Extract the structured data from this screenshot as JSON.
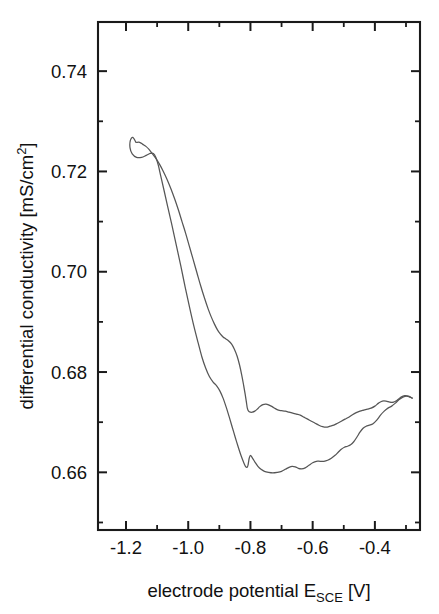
{
  "chart_data": {
    "type": "line",
    "title": "",
    "subtitle": "",
    "xlabel": "electrode potential E_SCE [V]",
    "xlabel_parts": {
      "main": "electrode potential E",
      "sub": "SCE",
      "tail": " [V]"
    },
    "ylabel": "differential conductivity [mS/cm^2]",
    "ylabel_parts": {
      "main": "differential conductivity [mS/cm",
      "sup": "2",
      "tail": "]"
    },
    "xlim": [
      -1.29,
      -0.255
    ],
    "ylim": [
      0.6485,
      0.7498
    ],
    "xticks": [
      -1.2,
      -1.0,
      -0.8,
      -0.6,
      -0.4
    ],
    "xtick_labels": [
      "-1.2",
      "-1.0",
      "-0.8",
      "-0.6",
      "-0.4"
    ],
    "xticks_minor": [
      -1.3,
      -1.1,
      -0.9,
      -0.7,
      -0.5,
      -0.3
    ],
    "yticks": [
      0.74,
      0.72,
      0.7,
      0.68,
      0.66
    ],
    "ytick_labels": [
      "0.74",
      "0.72",
      "0.70",
      "0.68",
      "0.66"
    ],
    "yticks_minor": [
      0.75,
      0.73,
      0.71,
      0.69,
      0.67,
      0.65
    ],
    "grid": false,
    "legend": false,
    "legend_position": "none",
    "tick_direction": "in",
    "frame": true,
    "line_color": "#565656",
    "axis_color": "#1a1a1a",
    "background_color": "#ffffff",
    "annotations": [],
    "series": [
      {
        "name": "cathodic (forward) sweep",
        "comment": "upper-left loop start, descends to the right, forms upper branch of hysteresis loop",
        "points": [
          [
            -1.168,
            0.7258
          ],
          [
            -1.178,
            0.7268
          ],
          [
            -1.186,
            0.7262
          ],
          [
            -1.187,
            0.7247
          ],
          [
            -1.18,
            0.7235
          ],
          [
            -1.166,
            0.7228
          ],
          [
            -1.15,
            0.7228
          ],
          [
            -1.135,
            0.7232
          ],
          [
            -1.122,
            0.7236
          ],
          [
            -1.112,
            0.7236
          ],
          [
            -1.104,
            0.7228
          ],
          [
            -1.096,
            0.7212
          ],
          [
            -1.088,
            0.719
          ],
          [
            -1.078,
            0.7163
          ],
          [
            -1.066,
            0.713
          ],
          [
            -1.052,
            0.7092
          ],
          [
            -1.038,
            0.7052
          ],
          [
            -1.024,
            0.7012
          ],
          [
            -1.01,
            0.697
          ],
          [
            -0.996,
            0.693
          ],
          [
            -0.982,
            0.6892
          ],
          [
            -0.968,
            0.6858
          ],
          [
            -0.956,
            0.683
          ],
          [
            -0.944,
            0.6808
          ],
          [
            -0.932,
            0.6791
          ],
          [
            -0.92,
            0.678
          ],
          [
            -0.908,
            0.6772
          ],
          [
            -0.898,
            0.6762
          ],
          [
            -0.888,
            0.6748
          ],
          [
            -0.878,
            0.673
          ],
          [
            -0.868,
            0.671
          ],
          [
            -0.858,
            0.6689
          ],
          [
            -0.848,
            0.6668
          ],
          [
            -0.838,
            0.6648
          ],
          [
            -0.83,
            0.6633
          ],
          [
            -0.822,
            0.662
          ],
          [
            -0.816,
            0.6612
          ],
          [
            -0.811,
            0.661
          ],
          [
            -0.808,
            0.6614
          ],
          [
            -0.806,
            0.6621
          ],
          [
            -0.804,
            0.6628
          ],
          [
            -0.8,
            0.6634
          ],
          [
            -0.793,
            0.6628
          ],
          [
            -0.785,
            0.662
          ],
          [
            -0.776,
            0.6612
          ],
          [
            -0.766,
            0.6606
          ],
          [
            -0.755,
            0.6602
          ],
          [
            -0.742,
            0.66
          ],
          [
            -0.728,
            0.6599
          ],
          [
            -0.714,
            0.66
          ],
          [
            -0.7,
            0.6602
          ],
          [
            -0.688,
            0.6606
          ],
          [
            -0.676,
            0.661
          ],
          [
            -0.666,
            0.6612
          ],
          [
            -0.656,
            0.6611
          ],
          [
            -0.646,
            0.6608
          ],
          [
            -0.636,
            0.6607
          ],
          [
            -0.624,
            0.6609
          ],
          [
            -0.612,
            0.6614
          ],
          [
            -0.6,
            0.6619
          ],
          [
            -0.588,
            0.6622
          ],
          [
            -0.576,
            0.6622
          ],
          [
            -0.564,
            0.6622
          ],
          [
            -0.552,
            0.6624
          ],
          [
            -0.54,
            0.6628
          ],
          [
            -0.528,
            0.6634
          ],
          [
            -0.518,
            0.664
          ],
          [
            -0.508,
            0.6646
          ],
          [
            -0.498,
            0.665
          ],
          [
            -0.488,
            0.6652
          ],
          [
            -0.478,
            0.6655
          ],
          [
            -0.468,
            0.6661
          ],
          [
            -0.458,
            0.667
          ],
          [
            -0.448,
            0.668
          ],
          [
            -0.438,
            0.6688
          ],
          [
            -0.428,
            0.6692
          ],
          [
            -0.418,
            0.6694
          ],
          [
            -0.406,
            0.6697
          ],
          [
            -0.394,
            0.6704
          ],
          [
            -0.382,
            0.6714
          ],
          [
            -0.37,
            0.6722
          ],
          [
            -0.358,
            0.6728
          ],
          [
            -0.346,
            0.6732
          ],
          [
            -0.334,
            0.6738
          ],
          [
            -0.322,
            0.6745
          ],
          [
            -0.31,
            0.675
          ],
          [
            -0.298,
            0.6752
          ],
          [
            -0.288,
            0.675
          ],
          [
            -0.28,
            0.6748
          ]
        ]
      },
      {
        "name": "anodic (return) sweep",
        "comment": "from right edge back left along the lower branch, then up the steep slope to the start loop",
        "points": [
          [
            -0.28,
            0.6748
          ],
          [
            -0.292,
            0.6752
          ],
          [
            -0.304,
            0.6753
          ],
          [
            -0.316,
            0.675
          ],
          [
            -0.328,
            0.6744
          ],
          [
            -0.34,
            0.674
          ],
          [
            -0.352,
            0.674
          ],
          [
            -0.364,
            0.6742
          ],
          [
            -0.376,
            0.6742
          ],
          [
            -0.388,
            0.6738
          ],
          [
            -0.4,
            0.6732
          ],
          [
            -0.412,
            0.6728
          ],
          [
            -0.424,
            0.6726
          ],
          [
            -0.436,
            0.6724
          ],
          [
            -0.448,
            0.6722
          ],
          [
            -0.46,
            0.6719
          ],
          [
            -0.472,
            0.6715
          ],
          [
            -0.484,
            0.671
          ],
          [
            -0.496,
            0.6706
          ],
          [
            -0.508,
            0.6702
          ],
          [
            -0.52,
            0.6698
          ],
          [
            -0.532,
            0.6694
          ],
          [
            -0.544,
            0.6692
          ],
          [
            -0.556,
            0.669
          ],
          [
            -0.568,
            0.6691
          ],
          [
            -0.58,
            0.6694
          ],
          [
            -0.592,
            0.6698
          ],
          [
            -0.604,
            0.6702
          ],
          [
            -0.616,
            0.6706
          ],
          [
            -0.628,
            0.671
          ],
          [
            -0.64,
            0.6714
          ],
          [
            -0.652,
            0.6716
          ],
          [
            -0.664,
            0.6718
          ],
          [
            -0.676,
            0.672
          ],
          [
            -0.688,
            0.6722
          ],
          [
            -0.7,
            0.6723
          ],
          [
            -0.71,
            0.6724
          ],
          [
            -0.72,
            0.6727
          ],
          [
            -0.73,
            0.6731
          ],
          [
            -0.74,
            0.6734
          ],
          [
            -0.75,
            0.6736
          ],
          [
            -0.76,
            0.6735
          ],
          [
            -0.77,
            0.6731
          ],
          [
            -0.778,
            0.6726
          ],
          [
            -0.786,
            0.6722
          ],
          [
            -0.794,
            0.672
          ],
          [
            -0.8,
            0.672
          ],
          [
            -0.806,
            0.6722
          ],
          [
            -0.81,
            0.6728
          ],
          [
            -0.813,
            0.674
          ],
          [
            -0.817,
            0.6756
          ],
          [
            -0.822,
            0.6774
          ],
          [
            -0.828,
            0.6794
          ],
          [
            -0.835,
            0.6814
          ],
          [
            -0.843,
            0.6832
          ],
          [
            -0.852,
            0.6846
          ],
          [
            -0.861,
            0.6856
          ],
          [
            -0.87,
            0.6862
          ],
          [
            -0.879,
            0.6866
          ],
          [
            -0.888,
            0.687
          ],
          [
            -0.897,
            0.6876
          ],
          [
            -0.906,
            0.6884
          ],
          [
            -0.916,
            0.6896
          ],
          [
            -0.926,
            0.691
          ],
          [
            -0.936,
            0.6926
          ],
          [
            -0.948,
            0.6948
          ],
          [
            -0.96,
            0.6972
          ],
          [
            -0.972,
            0.6998
          ],
          [
            -0.984,
            0.7024
          ],
          [
            -0.996,
            0.705
          ],
          [
            -1.008,
            0.7076
          ],
          [
            -1.02,
            0.71
          ],
          [
            -1.032,
            0.7124
          ],
          [
            -1.044,
            0.7146
          ],
          [
            -1.056,
            0.7166
          ],
          [
            -1.068,
            0.7184
          ],
          [
            -1.08,
            0.72
          ],
          [
            -1.092,
            0.7214
          ],
          [
            -1.104,
            0.7226
          ],
          [
            -1.116,
            0.7236
          ],
          [
            -1.126,
            0.7244
          ],
          [
            -1.136,
            0.725
          ],
          [
            -1.146,
            0.7254
          ],
          [
            -1.156,
            0.7258
          ],
          [
            -1.166,
            0.7258
          ]
        ]
      }
    ]
  },
  "figure": {
    "plot_area": {
      "left": 98,
      "top": 22,
      "right": 420,
      "bottom": 530
    }
  }
}
